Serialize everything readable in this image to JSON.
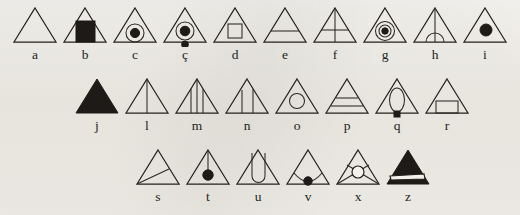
{
  "figure": {
    "background_color": "#f3f1ec",
    "ink_color": "#24201d",
    "rows": [
      {
        "name": "row-1",
        "cells": [
          {
            "label": "a",
            "glyph": "plain-triangle",
            "description": "empty outline triangle"
          },
          {
            "label": "b",
            "glyph": "triangle-filled-square",
            "description": "triangle with solid black square on base"
          },
          {
            "label": "c",
            "glyph": "triangle-circle-dot",
            "description": "triangle with circle containing filled dot"
          },
          {
            "label": "ç",
            "glyph": "triangle-circle-dot-cedilla",
            "description": "triangle with circle, filled dot, and dot below base"
          },
          {
            "label": "d",
            "glyph": "triangle-open-square",
            "description": "triangle with open square inside"
          },
          {
            "label": "e",
            "glyph": "triangle-one-band",
            "description": "triangle with one horizontal line"
          },
          {
            "label": "f",
            "glyph": "triangle-cross",
            "description": "triangle with vertical and horizontal line forming a cross"
          },
          {
            "label": "g",
            "glyph": "triangle-double-circle-dot",
            "description": "triangle with concentric circle and filled dot"
          },
          {
            "label": "h",
            "glyph": "triangle-arch",
            "description": "triangle with vertical line and semicircular arch at base"
          },
          {
            "label": "i",
            "glyph": "triangle-dot",
            "description": "triangle with a single filled dot"
          }
        ]
      },
      {
        "name": "row-2",
        "cells": [
          {
            "label": "j",
            "glyph": "triangle-solid",
            "description": "fully filled black triangle"
          },
          {
            "label": "l",
            "glyph": "triangle-one-vertical",
            "description": "triangle with one vertical line from apex"
          },
          {
            "label": "m",
            "glyph": "triangle-three-verticals",
            "description": "triangle with three vertical lines"
          },
          {
            "label": "n",
            "glyph": "triangle-two-verticals",
            "description": "triangle with two vertical lines"
          },
          {
            "label": "o",
            "glyph": "triangle-circle",
            "description": "triangle with open circle inside"
          },
          {
            "label": "p",
            "glyph": "triangle-two-bands",
            "description": "triangle with two horizontal lines"
          },
          {
            "label": "q",
            "glyph": "triangle-oval-stem",
            "description": "triangle with tall oval and small filled stem at base"
          },
          {
            "label": "r",
            "glyph": "triangle-rectangle",
            "description": "triangle with open rectangle on base"
          }
        ]
      },
      {
        "name": "row-3",
        "cells": [
          {
            "label": "s",
            "glyph": "triangle-diagonal",
            "description": "triangle with diagonal line from base-left to right side"
          },
          {
            "label": "t",
            "glyph": "triangle-apex-line-dot",
            "description": "triangle with vertical line from apex ending in filled dot"
          },
          {
            "label": "u",
            "glyph": "triangle-u-shape",
            "description": "triangle with U-shaped loop rising to apex"
          },
          {
            "label": "v",
            "glyph": "triangle-arc-dot",
            "description": "triangle with low arc and filled dot at base centre"
          },
          {
            "label": "x",
            "glyph": "triangle-crossed-circle",
            "description": "triangle with crossed diagonals and circle at intersection"
          },
          {
            "label": "z",
            "glyph": "triangle-solid-wedge",
            "description": "solid black triangle with white wedge band"
          }
        ]
      }
    ]
  }
}
